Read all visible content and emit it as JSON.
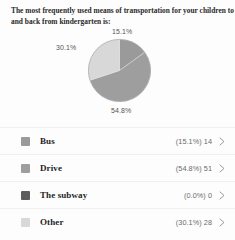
{
  "question": {
    "line1": "The most frequently used means of transportation for your children to",
    "line2": "and back from kindergarten is:"
  },
  "chart_labels": {
    "bus": "15.1%",
    "other": "30.1%",
    "drive": "54.8%",
    "subway": "0.0%"
  },
  "legend": {
    "rows": [
      {
        "label": "Bus",
        "value": "(15.1%) 14",
        "color": "#9a9a9a",
        "chevron": "chevron-right-icon"
      },
      {
        "label": "Drive",
        "value": "(54.8%) 51",
        "color": "#9e9e9e",
        "chevron": "chevron-right-icon"
      },
      {
        "label": "The subway",
        "value": "(0.0%) 0",
        "color": "#5c5c5c",
        "chevron": "chevron-right-icon"
      },
      {
        "label": "Other",
        "value": "(30.1%) 28",
        "color": "#d8d8d8",
        "chevron": "chevron-right-icon"
      }
    ]
  },
  "chart_data": {
    "type": "pie",
    "title": "The most frequently used means of transportation for your children to and back from kindergarten is:",
    "categories": [
      "Bus",
      "Drive",
      "The subway",
      "Other"
    ],
    "values": [
      14,
      51,
      0,
      28
    ],
    "percentages": [
      15.1,
      54.8,
      0.0,
      30.1
    ],
    "colors": [
      "#9a9a9a",
      "#9e9e9e",
      "#5c5c5c",
      "#d8d8d8"
    ],
    "total": 93,
    "legend_position": "bottom",
    "grid": false,
    "start_angle_deg": 0,
    "direction": "clockwise",
    "data_labels": [
      "15.1%",
      "54.8%",
      "",
      "30.1%"
    ]
  }
}
